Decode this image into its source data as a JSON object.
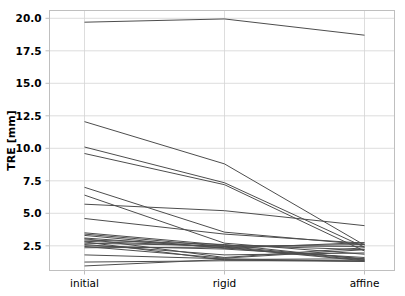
{
  "chart_data": {
    "type": "line",
    "title": "",
    "subtitle": "",
    "xlabel": "",
    "ylabel": "TRE [mm]",
    "categories": [
      "initial",
      "rigid",
      "affine"
    ],
    "x": [
      0,
      1,
      2
    ],
    "ylim": [
      0.6,
      20.6
    ],
    "yticks": [
      2.5,
      5.0,
      7.5,
      10.0,
      12.5,
      15.0,
      17.5,
      20.0
    ],
    "ytick_labels": [
      "2.5",
      "5.0",
      "7.5",
      "10.0",
      "12.5",
      "15.0",
      "17.5",
      "20.0"
    ],
    "xtick_labels": [
      "initial",
      "rigid",
      "affine"
    ],
    "grid": true,
    "grid_color": "#d4d4d4",
    "legend": false,
    "legend_position": "none",
    "line_color": "#4d4d4d",
    "line_width": 1.0,
    "axis_color": "#bfbfbf",
    "background": "#ffffff",
    "series": [
      {
        "name": "case-01",
        "values": [
          19.7,
          19.95,
          18.7
        ]
      },
      {
        "name": "case-02",
        "values": [
          12.05,
          8.8,
          2.55
        ]
      },
      {
        "name": "case-03",
        "values": [
          10.1,
          7.35,
          2.4
        ]
      },
      {
        "name": "case-04",
        "values": [
          9.6,
          7.2,
          2.1
        ]
      },
      {
        "name": "case-05",
        "values": [
          7.0,
          3.55,
          2.6
        ]
      },
      {
        "name": "case-06",
        "values": [
          6.4,
          2.7,
          1.85
        ]
      },
      {
        "name": "case-07",
        "values": [
          5.7,
          5.2,
          4.05
        ]
      },
      {
        "name": "case-08",
        "values": [
          4.6,
          3.4,
          2.7
        ]
      },
      {
        "name": "case-09",
        "values": [
          3.5,
          2.55,
          2.2
        ]
      },
      {
        "name": "case-10",
        "values": [
          3.4,
          2.45,
          1.5
        ]
      },
      {
        "name": "case-11",
        "values": [
          3.3,
          2.3,
          2.75
        ]
      },
      {
        "name": "case-12",
        "values": [
          3.1,
          2.35,
          1.35
        ]
      },
      {
        "name": "case-13",
        "values": [
          3.05,
          1.6,
          2.35
        ]
      },
      {
        "name": "case-14",
        "values": [
          2.95,
          2.6,
          1.45
        ]
      },
      {
        "name": "case-15",
        "values": [
          2.85,
          2.45,
          2.6
        ]
      },
      {
        "name": "case-16",
        "values": [
          2.8,
          1.4,
          1.3
        ]
      },
      {
        "name": "case-17",
        "values": [
          2.7,
          2.5,
          2.45
        ]
      },
      {
        "name": "case-18",
        "values": [
          2.6,
          1.8,
          1.95
        ]
      },
      {
        "name": "case-19",
        "values": [
          2.5,
          2.25,
          1.6
        ]
      },
      {
        "name": "case-20",
        "values": [
          2.45,
          1.55,
          2.2
        ]
      },
      {
        "name": "case-21",
        "values": [
          2.35,
          2.4,
          1.4
        ]
      },
      {
        "name": "case-22",
        "values": [
          1.8,
          1.5,
          1.3
        ]
      },
      {
        "name": "case-23",
        "values": [
          1.25,
          1.35,
          1.35
        ]
      },
      {
        "name": "case-24",
        "values": [
          0.95,
          1.45,
          1.5
        ]
      }
    ]
  }
}
